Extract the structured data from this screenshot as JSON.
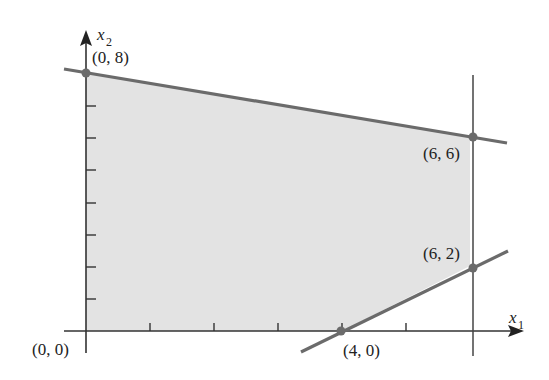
{
  "figure": {
    "type": "feasible-region",
    "axes": {
      "x_label": "x",
      "x_sub": "1",
      "y_label": "x",
      "y_sub": "2",
      "x_ticks": [
        1,
        2,
        3,
        4,
        5
      ],
      "y_ticks": [
        1,
        2,
        3,
        4,
        5,
        6,
        7
      ]
    },
    "region_color": "#e3e3e3",
    "line_color": "#6b6b6b",
    "axis_color": "#333333",
    "vertices": [
      {
        "x": 0,
        "y": 0,
        "label": "(0, 0)"
      },
      {
        "x": 0,
        "y": 8,
        "label": "(0, 8)"
      },
      {
        "x": 6,
        "y": 6,
        "label": "(6, 6)"
      },
      {
        "x": 6,
        "y": 2,
        "label": "(6, 2)"
      },
      {
        "x": 4,
        "y": 0,
        "label": "(4, 0)"
      }
    ],
    "constraint_lines": [
      {
        "name": "upper",
        "from": [
          -0.3,
          8.1
        ],
        "to": [
          6.5,
          5.83
        ]
      },
      {
        "name": "vertical",
        "x": 6
      },
      {
        "name": "lower",
        "from": [
          3.3,
          -0.7
        ],
        "to": [
          6.5,
          2.5
        ]
      }
    ]
  },
  "labels": {
    "v00": "(0, 0)",
    "v08": "(0, 8)",
    "v66": "(6, 6)",
    "v62": "(6, 2)",
    "v40": "(4, 0)",
    "x1": "x",
    "x1sub": "1",
    "x2": "x",
    "x2sub": "2"
  }
}
